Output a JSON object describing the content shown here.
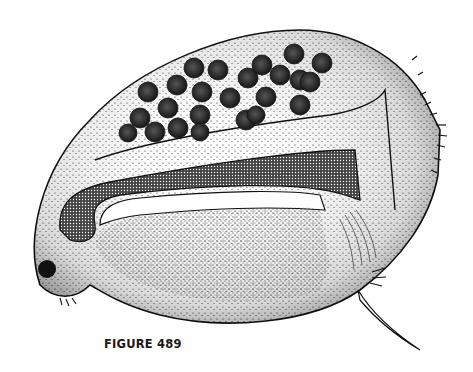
{
  "figure": {
    "caption": "FIGURE 489",
    "egg_count": 24,
    "colors": {
      "ink": "#111111",
      "paper": "#ffffff"
    }
  }
}
